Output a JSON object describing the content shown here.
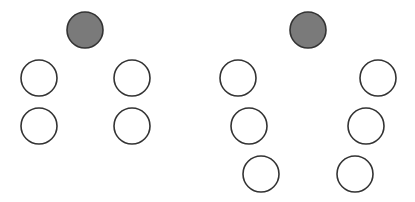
{
  "canvas": {
    "width": 415,
    "height": 202,
    "background": "#ffffff"
  },
  "style": {
    "stroke": "#333333",
    "stroke_width": 1.6,
    "filled_color": "#7a7a7a",
    "empty_color": "#ffffff",
    "radius": 18
  },
  "figures": [
    {
      "name": "left-arrangement",
      "nodes": [
        {
          "role": "apex",
          "filled": true,
          "cx": 85,
          "cy": 30
        },
        {
          "role": "left-1",
          "filled": false,
          "cx": 39,
          "cy": 78
        },
        {
          "role": "right-1",
          "filled": false,
          "cx": 132,
          "cy": 78
        },
        {
          "role": "left-2",
          "filled": false,
          "cx": 39,
          "cy": 126
        },
        {
          "role": "right-2",
          "filled": false,
          "cx": 132,
          "cy": 126
        }
      ]
    },
    {
      "name": "right-arrangement",
      "nodes": [
        {
          "role": "apex",
          "filled": true,
          "cx": 308,
          "cy": 30
        },
        {
          "role": "left-1",
          "filled": false,
          "cx": 238,
          "cy": 78
        },
        {
          "role": "right-1",
          "filled": false,
          "cx": 378,
          "cy": 78
        },
        {
          "role": "left-2",
          "filled": false,
          "cx": 249,
          "cy": 126
        },
        {
          "role": "right-2",
          "filled": false,
          "cx": 366,
          "cy": 126
        },
        {
          "role": "left-3",
          "filled": false,
          "cx": 261,
          "cy": 174
        },
        {
          "role": "right-3",
          "filled": false,
          "cx": 355,
          "cy": 174
        }
      ]
    }
  ]
}
